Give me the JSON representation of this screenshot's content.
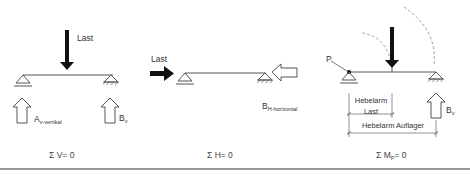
{
  "diagrams": [
    {
      "id": "vertical-equilibrium",
      "load_label": "Last",
      "reaction_a_label": "A",
      "reaction_a_sub": "v-vertikal",
      "reaction_b_label": "B",
      "reaction_b_sub": "v",
      "equation_symbol": "Σ",
      "equation_var": "V",
      "equation_sub": "",
      "equation_rest": "=  0"
    },
    {
      "id": "horizontal-equilibrium",
      "load_label": "Last",
      "reaction_b_label": "B",
      "reaction_b_sub": "H-horizontal",
      "equation_symbol": "Σ",
      "equation_var": "H",
      "equation_sub": "",
      "equation_rest": "=  0"
    },
    {
      "id": "moment-equilibrium",
      "pivot_label": "P",
      "lever_load_line1": "Hebelarm",
      "lever_load_line2": "Last",
      "lever_support": "Hebelarm Auflager",
      "reaction_b_label": "B",
      "reaction_b_sub": "v",
      "equation_symbol": "Σ",
      "equation_var": "M",
      "equation_sub": "P",
      "equation_rest": "=  0"
    }
  ],
  "colors": {
    "line": "#555555",
    "load_arrow": "#111111",
    "dashed_arc": "#999999",
    "rule": "#9a9a9a"
  }
}
